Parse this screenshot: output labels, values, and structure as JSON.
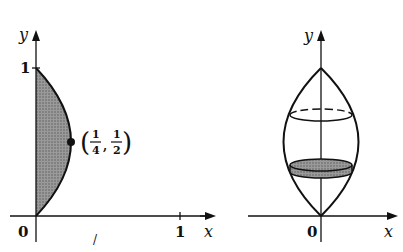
{
  "figure": {
    "left_panel": {
      "description": "Region bounded by curve x = y - y^2 (parabola) and y-axis, shaded",
      "axis_x_label": "x",
      "axis_y_label": "y",
      "origin_label": "0",
      "x_tick_label": "1",
      "y_tick_label": "1",
      "point": {
        "x_num": "1",
        "x_den": "4",
        "y_num": "1",
        "y_den": "2",
        "separator": ","
      },
      "colors": {
        "shade": "#8a8a8a",
        "stroke": "#111111"
      }
    },
    "right_panel": {
      "description": "Solid of revolution about y-axis with a shaded disk slice",
      "axis_x_label": "x",
      "axis_y_label": "y",
      "origin_label": "0",
      "colors": {
        "shade": "#7a7a7a",
        "stroke": "#111111"
      }
    },
    "stray_mark": "/"
  }
}
